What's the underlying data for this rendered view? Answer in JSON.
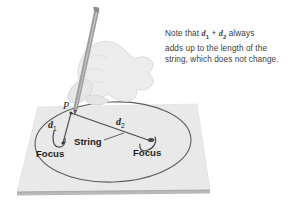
{
  "figure": {
    "kind": "ellipse-construction-diagram",
    "background_color": "#ffffff",
    "callout": {
      "line1_prefix": "Note that ",
      "var1": "d",
      "var1_sub": "1",
      "plus": " + ",
      "var2": "d",
      "var2_sub": "2",
      "line1_suffix": " always",
      "line2": "adds up to the length of the",
      "line3": "string, which does not change.",
      "text_color": "#3b3b3b"
    },
    "labels": {
      "point_p": "P",
      "d1": "d",
      "d1_sub": "1",
      "d2": "d",
      "d2_sub": "2",
      "string": "String",
      "focus_left": "Focus",
      "focus_right": "Focus"
    },
    "colors": {
      "paper_fill": "#e8e8e8",
      "paper_edge": "#c9c9c9",
      "paper_front_edge": "#b4b4b4",
      "ellipse_stroke": "#5a5a5a",
      "string_stroke": "#4a4a4a",
      "hand_fill": "#ededed",
      "hand_stroke": "#d2d2d2",
      "pencil_body": "#9a9a9a",
      "pencil_tip": "#6e6e6e",
      "pin_color": "#4c4c4c",
      "label_color": "#1e1e1e"
    }
  }
}
